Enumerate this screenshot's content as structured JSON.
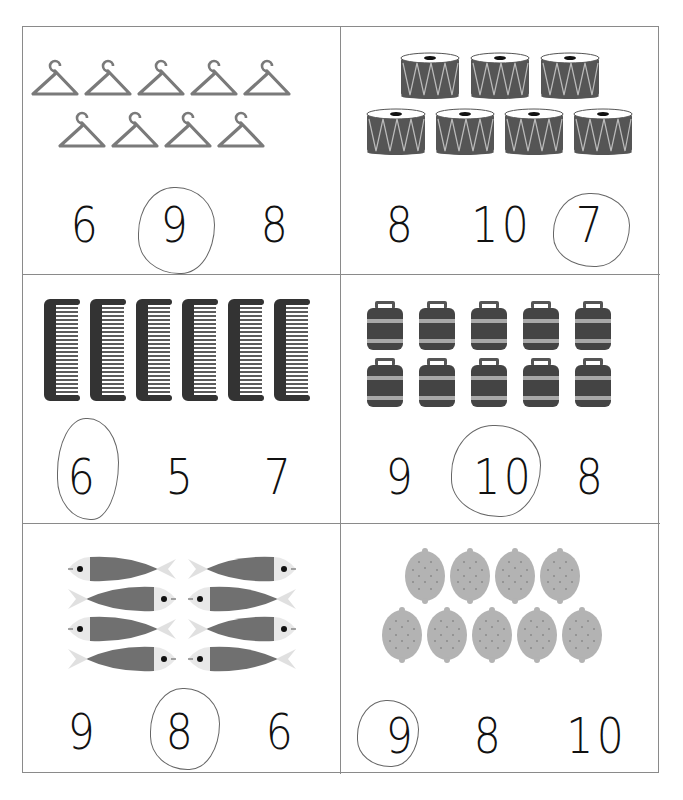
{
  "worksheet": {
    "title_fragment": "",
    "cells": [
      {
        "object": "hanger",
        "count": 9,
        "rows": [
          5,
          4
        ],
        "options": [
          "6",
          "9",
          "8"
        ],
        "circled": "9"
      },
      {
        "object": "drum",
        "count": 7,
        "rows": [
          3,
          4
        ],
        "options": [
          "8",
          "10",
          "7"
        ],
        "circled": "7"
      },
      {
        "object": "comb",
        "count": 6,
        "rows": [
          6
        ],
        "options": [
          "6",
          "5",
          "7"
        ],
        "circled": "6"
      },
      {
        "object": "jar",
        "count": 10,
        "rows": [
          5,
          5
        ],
        "options": [
          "9",
          "10",
          "8"
        ],
        "circled": "10"
      },
      {
        "object": "fish",
        "count": 8,
        "rows": [
          2,
          2,
          2,
          2
        ],
        "options": [
          "9",
          "8",
          "6"
        ],
        "circled": "8"
      },
      {
        "object": "lemon",
        "count": 9,
        "rows": [
          4,
          5
        ],
        "options": [
          "9",
          "8",
          "10"
        ],
        "circled": "9"
      }
    ]
  },
  "colors": {
    "grid_line": "#8a8a8a",
    "object_gray": "#7a7a7a",
    "object_dark": "#555555",
    "comb_dark": "#333333",
    "lemon": "#b3b3b3",
    "stripe_light": "#a8a8a8",
    "pencil": "#666666",
    "digit": "#111111"
  }
}
